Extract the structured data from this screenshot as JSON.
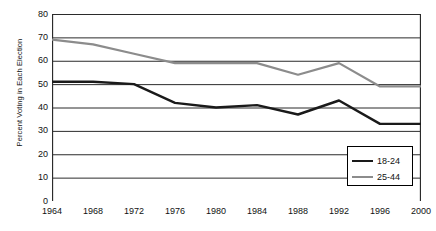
{
  "chart_data": {
    "type": "line",
    "title": "",
    "xlabel": "",
    "ylabel": "Percent Voting in Each Election",
    "categories": [
      1964,
      1968,
      1972,
      1976,
      1980,
      1984,
      1988,
      1992,
      1996,
      2000
    ],
    "x_tick_labels": [
      "1964",
      "1968",
      "1972",
      "1976",
      "1980",
      "1984",
      "1988",
      "1992",
      "1996",
      "2000"
    ],
    "y_tick_labels": [
      "0",
      "10",
      "20",
      "30",
      "40",
      "50",
      "60",
      "70",
      "80"
    ],
    "y_ticks": [
      0,
      10,
      20,
      30,
      40,
      50,
      60,
      70,
      80
    ],
    "ylim": [
      0,
      80
    ],
    "xlim": [
      1964,
      2000
    ],
    "grid": "horizontal",
    "legend_position": "bottom-right",
    "series": [
      {
        "name": "18-24",
        "color": "#1a1a1a",
        "values": [
          51,
          51,
          50,
          42,
          40,
          41,
          37,
          43,
          33,
          33
        ]
      },
      {
        "name": "25-44",
        "color": "#8c8c8c",
        "values": [
          69,
          67,
          63,
          59,
          59,
          59,
          54,
          59,
          49,
          49
        ]
      }
    ]
  },
  "legend": {
    "entries": [
      {
        "label": "18-24"
      },
      {
        "label": "25-44"
      }
    ]
  }
}
